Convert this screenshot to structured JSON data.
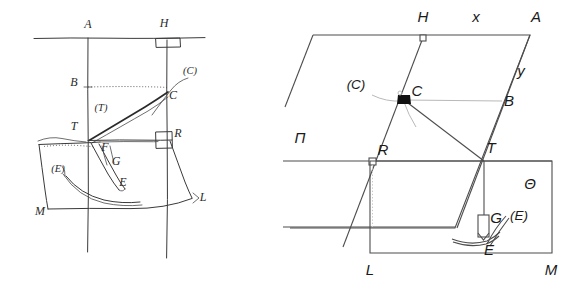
{
  "figure": {
    "background_color": "#ffffff",
    "ink_color": "#3a3a3a",
    "clean_ink_color": "#4d4d4d",
    "accent_color": "#111111",
    "width": 583,
    "height": 289
  },
  "left_diagram": {
    "name": "hand-drawn-sketch",
    "style": "historical ink sketch",
    "labels": [
      {
        "id": "A",
        "text": "A",
        "x": 88,
        "y": 28
      },
      {
        "id": "H",
        "text": "H",
        "x": 164,
        "y": 27
      },
      {
        "id": "B",
        "text": "B",
        "x": 74,
        "y": 86
      },
      {
        "id": "Cp",
        "text": "(C)",
        "x": 190,
        "y": 74
      },
      {
        "id": "C",
        "text": "C",
        "x": 173,
        "y": 99
      },
      {
        "id": "Tp",
        "text": "(T)",
        "x": 101,
        "y": 111
      },
      {
        "id": "T",
        "text": "T",
        "x": 74,
        "y": 130
      },
      {
        "id": "R",
        "text": "R",
        "x": 178,
        "y": 137
      },
      {
        "id": "F",
        "text": "F",
        "x": 105,
        "y": 151
      },
      {
        "id": "G",
        "text": "G",
        "x": 116,
        "y": 165
      },
      {
        "id": "E",
        "text": "E",
        "x": 123,
        "y": 186
      },
      {
        "id": "Ep",
        "text": "(E)",
        "x": 58,
        "y": 172
      },
      {
        "id": "M",
        "text": "M",
        "x": 40,
        "y": 215
      },
      {
        "id": "L",
        "text": "L",
        "x": 199,
        "y": 198
      }
    ]
  },
  "right_diagram": {
    "name": "clean-redrawing",
    "style": "modern line redrawing",
    "labels": [
      {
        "id": "H",
        "text": "H",
        "x": 423,
        "y": 22
      },
      {
        "id": "x",
        "text": "x",
        "x": 476,
        "y": 22
      },
      {
        "id": "A",
        "text": "A",
        "x": 534,
        "y": 22
      },
      {
        "id": "y",
        "text": "y",
        "x": 520,
        "y": 75
      },
      {
        "id": "B",
        "text": "B",
        "x": 506,
        "y": 105
      },
      {
        "id": "Cp",
        "text": "(C)",
        "x": 355,
        "y": 88
      },
      {
        "id": "C",
        "text": "C",
        "x": 405,
        "y": 96
      },
      {
        "id": "Pi",
        "text": "Π",
        "x": 300,
        "y": 140
      },
      {
        "id": "R",
        "text": "R",
        "x": 375,
        "y": 156
      },
      {
        "id": "T",
        "text": "T",
        "x": 485,
        "y": 154
      },
      {
        "id": "Th",
        "text": "Θ",
        "x": 530,
        "y": 185
      },
      {
        "id": "G",
        "text": "G",
        "x": 484,
        "y": 220
      },
      {
        "id": "Ep",
        "text": "(E)",
        "x": 508,
        "y": 218
      },
      {
        "id": "E",
        "text": "E",
        "x": 490,
        "y": 248
      },
      {
        "id": "L",
        "text": "L",
        "x": 369,
        "y": 272
      },
      {
        "id": "M",
        "text": "M",
        "x": 549,
        "y": 272
      }
    ]
  }
}
